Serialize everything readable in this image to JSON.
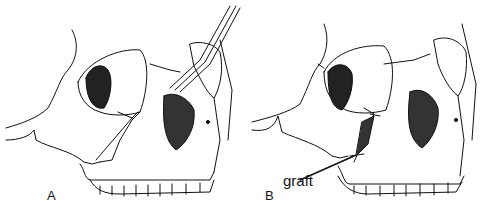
{
  "figure": {
    "panels": [
      {
        "label": "A"
      },
      {
        "label": "B",
        "annotation": "graft"
      }
    ]
  }
}
